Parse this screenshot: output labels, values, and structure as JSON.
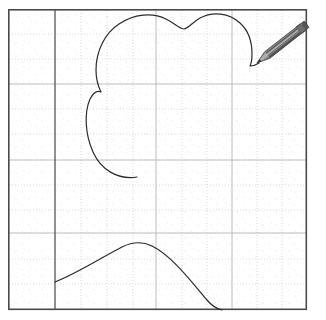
{
  "app": {
    "title": "Drawing Canvas",
    "background_color": "#ffffff"
  },
  "canvas": {
    "name": "drawing-canvas",
    "border_color": "#4a4a4a",
    "border_width": 1.6,
    "bounds": {
      "x": 8,
      "y": 9,
      "width": 299,
      "height": 301
    },
    "paper_color": "#fefefe"
  },
  "grid": {
    "major_line_color": "#b9b9b9",
    "minor_line_color": "#d8d8d8",
    "dotted_line_color": "#cfcfcf",
    "accent_line_color": "#555555",
    "accent_line_width": 1.3,
    "vertical_accent_x": 55,
    "vertical_major_x": [
      55,
      156,
      232
    ],
    "horizontal_major_y": [
      84,
      160,
      233
    ],
    "vertical_dotted_x": [
      81,
      107,
      133,
      182,
      207,
      257,
      282
    ],
    "horizontal_dotted_y": [
      34,
      59,
      109,
      134,
      185,
      210,
      259,
      284
    ],
    "speck_color": "#e6e6e6"
  },
  "drawing": {
    "stroke_color": "#2b2b2b",
    "stroke_width": 1.2,
    "paths": [
      {
        "name": "cloud-blob-stroke",
        "description": "open cloud-like blob with notch at top and left lobe, tail ending mid-canvas",
        "d": "M 137 177 C 118 180 101 170 93 152 C 85 134 84 113 90 99 C 93 93 97 90 101 92 C 98 86 96 79 96 70 C 96 51 105 33 119 24 C 134 14 152 12 166 19 C 174 23 180 29 184 29 C 189 28 193 22 200 18 C 213 11 229 13 240 23 C 249 31 252 42 252 54 C 252 60 251 64 250 66 C 252 66 256 65 259 63"
      },
      {
        "name": "bottom-arc-stroke",
        "description": "arc from the accent vertical line rising to a peak then falling off bottom edge",
        "d": "M 55 282 C 80 272 104 256 122 247 C 132 242 142 241 152 246 C 172 256 190 280 207 300 C 212 306 217 309 222 310"
      }
    ]
  },
  "cursor": {
    "name": "pencil-cursor",
    "tip": {
      "x": 257,
      "y": 63
    },
    "tail": {
      "x": 305,
      "y": 25
    },
    "body_color": "#7a7a7a",
    "body_dark": "#4f4f4f",
    "body_light": "#a8a8a8",
    "tip_color": "#3a3a3a",
    "ferrule_color": "#6a6a6a",
    "angle_degrees": -38
  }
}
